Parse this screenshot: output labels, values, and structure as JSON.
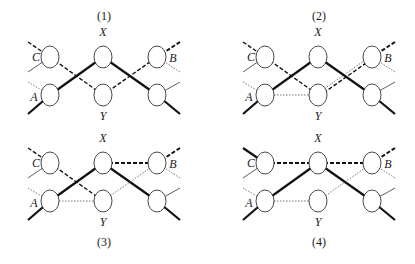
{
  "panels": [
    {
      "caption": "(1)",
      "caption_position": "top",
      "node_labels": {
        "top_center": "X",
        "bottom_center": "Y",
        "left_top": "C",
        "left_bottom": "A",
        "right_top": "B"
      },
      "links": [
        {
          "from": "left_bottom",
          "to": "top_center",
          "style": "thick"
        },
        {
          "from": "top_center",
          "to": "right_bottom",
          "style": "thick"
        },
        {
          "from": "left_top",
          "to": "bottom_center",
          "style": "dashed"
        },
        {
          "from": "bottom_center",
          "to": "right_top",
          "style": "dashed"
        }
      ]
    },
    {
      "caption": "(2)",
      "caption_position": "top",
      "node_labels": {
        "top_center": "X",
        "bottom_center": "Y",
        "left_top": "C",
        "left_bottom": "A",
        "right_top": "B"
      },
      "links": [
        {
          "from": "left_bottom",
          "to": "top_center",
          "style": "thick"
        },
        {
          "from": "top_center",
          "to": "right_bottom",
          "style": "thick"
        },
        {
          "from": "left_top",
          "to": "bottom_center",
          "style": "dashed"
        },
        {
          "from": "bottom_center",
          "to": "right_top",
          "style": "dashed+dotted"
        },
        {
          "from": "left_bottom",
          "to": "bottom_center",
          "style": "dotted"
        }
      ]
    },
    {
      "caption": "(3)",
      "caption_position": "bottom",
      "node_labels": {
        "top_center": "X",
        "bottom_center": "Y",
        "left_top": "C",
        "left_bottom": "A",
        "right_top": "B"
      },
      "links": [
        {
          "from": "left_bottom",
          "to": "top_center",
          "style": "thick"
        },
        {
          "from": "top_center",
          "to": "right_bottom",
          "style": "thick"
        },
        {
          "from": "left_top",
          "to": "bottom_center",
          "style": "dashed"
        },
        {
          "from": "top_center",
          "to": "right_top",
          "style": "dashed-heavy"
        },
        {
          "from": "bottom_center",
          "to": "right_top",
          "style": "dotted"
        },
        {
          "from": "left_bottom",
          "to": "bottom_center",
          "style": "dotted"
        }
      ]
    },
    {
      "caption": "(4)",
      "caption_position": "bottom",
      "node_labels": {
        "top_center": "X",
        "bottom_center": "Y",
        "left_top": "C",
        "left_bottom": "A",
        "right_top": "B"
      },
      "links": [
        {
          "from": "left_bottom",
          "to": "top_center",
          "style": "thick"
        },
        {
          "from": "top_center",
          "to": "right_bottom",
          "style": "thick"
        },
        {
          "from": "left_top",
          "to": "top_center",
          "style": "dashed-heavy"
        },
        {
          "from": "top_center",
          "to": "right_top",
          "style": "dashed-heavy"
        },
        {
          "from": "bottom_center",
          "to": "right_top",
          "style": "dotted"
        },
        {
          "from": "left_bottom",
          "to": "bottom_center",
          "style": "dotted"
        }
      ]
    }
  ]
}
